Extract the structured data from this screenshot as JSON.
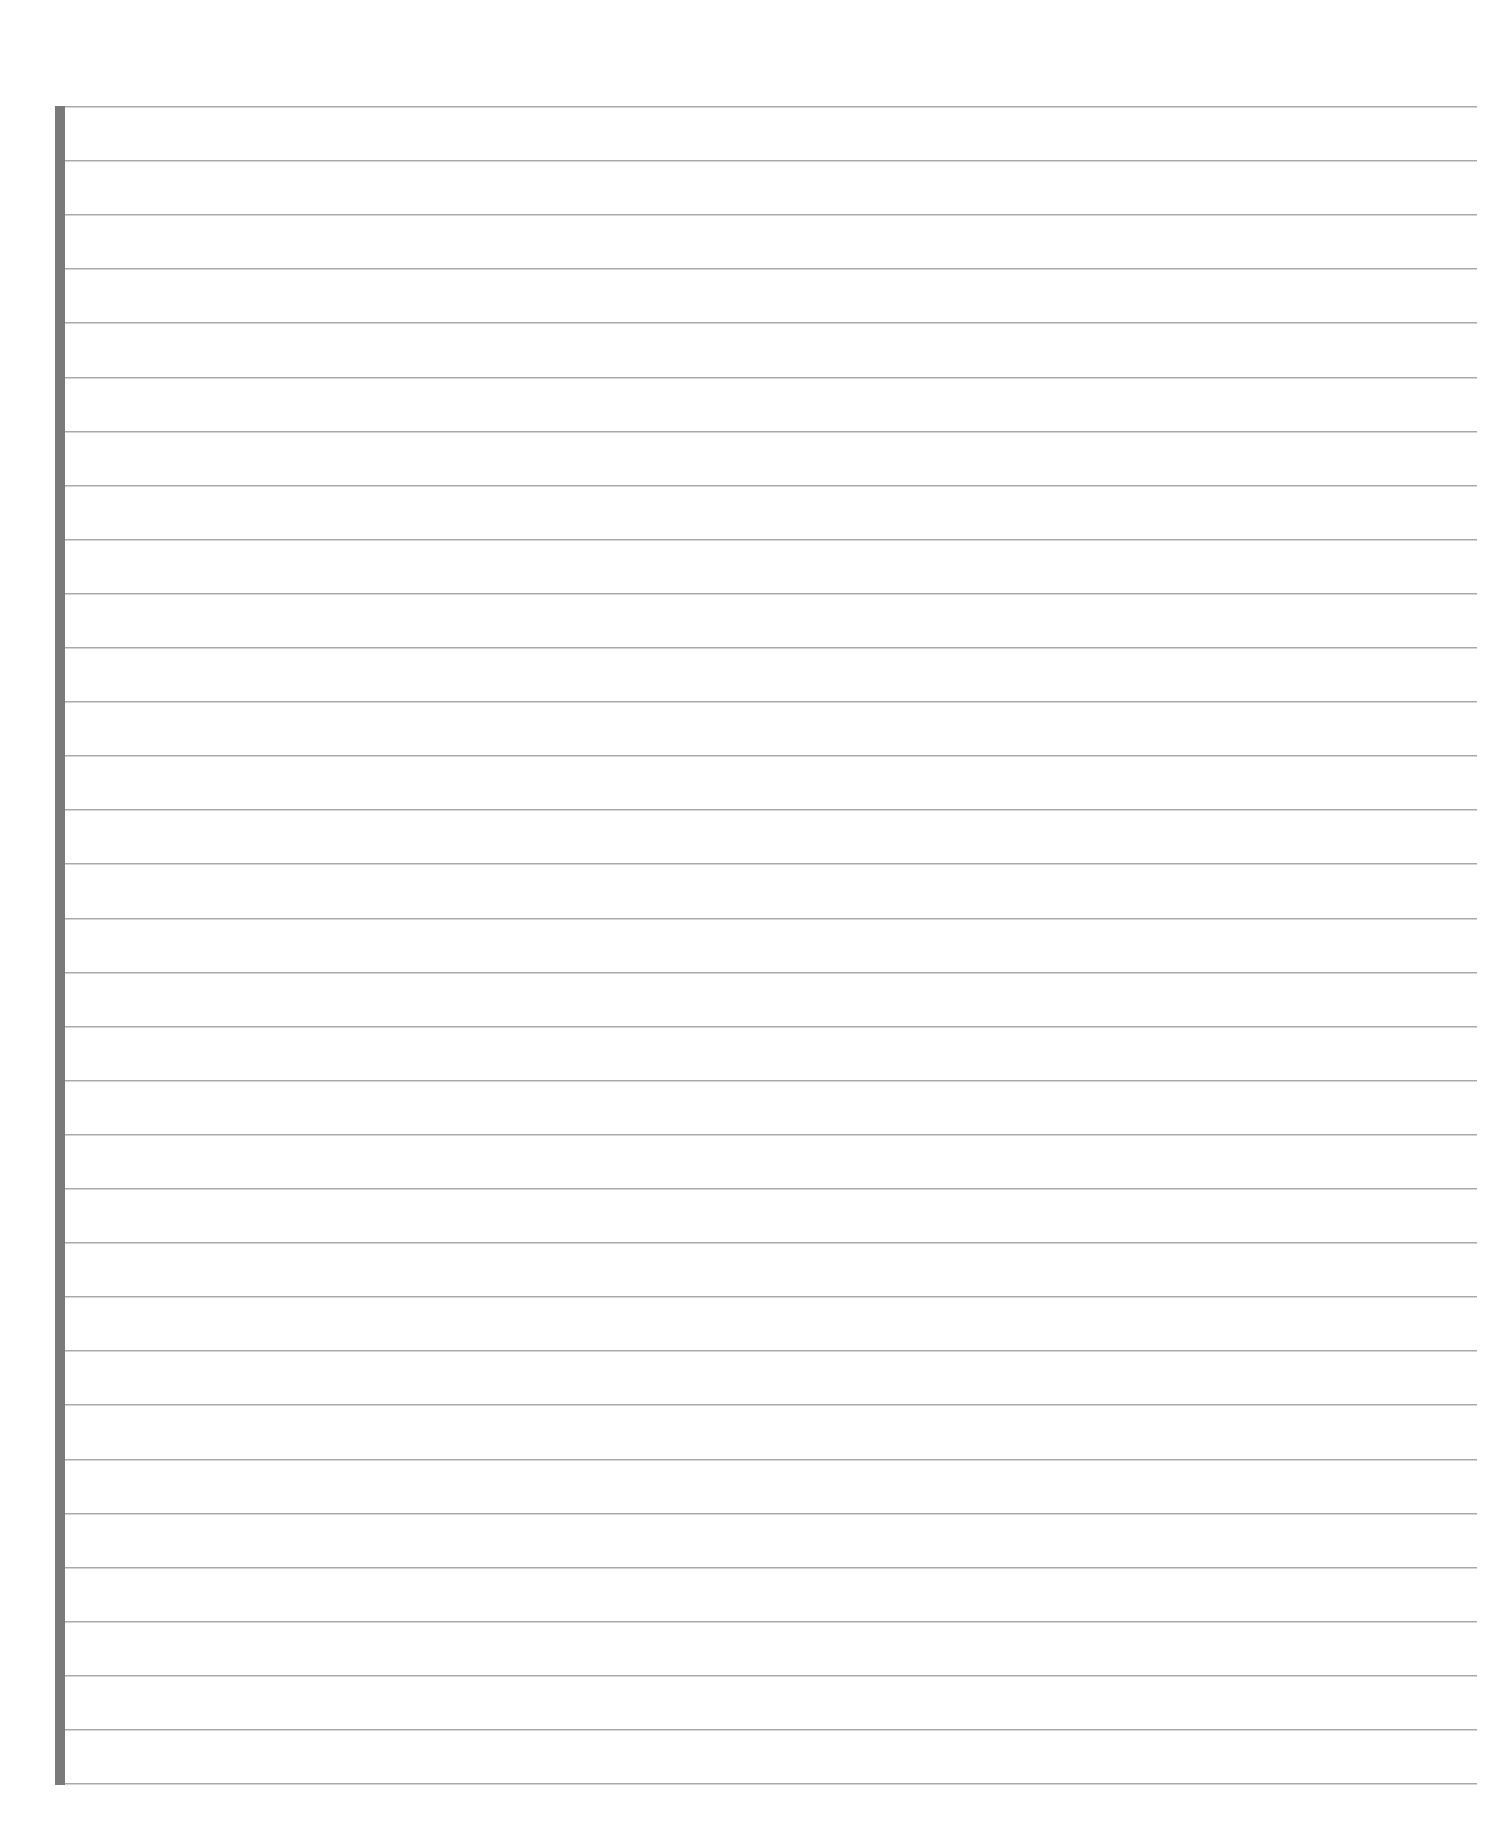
{
  "page": {
    "type": "blank-lined-paper",
    "background_color": "#ffffff",
    "margin_bar": {
      "color": "#7a7a7a",
      "side": "left"
    },
    "lines": {
      "count": 32,
      "color": "#a9a9a9",
      "first_y": 106,
      "spacing": 54.1
    },
    "text": ""
  }
}
